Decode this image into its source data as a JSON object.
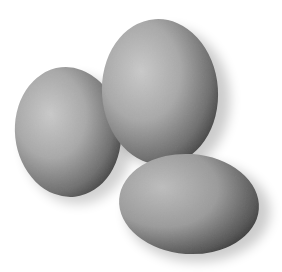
{
  "image": {
    "description": "Three grayscale eggs on a white background",
    "background": "#ffffff"
  },
  "eggs": [
    {
      "name": "left-egg",
      "cx": 68,
      "cy": 132,
      "rx": 53,
      "ry": 65,
      "rotate": -6
    },
    {
      "name": "top-egg",
      "cx": 160,
      "cy": 92,
      "rx": 58,
      "ry": 73,
      "rotate": -4
    },
    {
      "name": "bottom-right-egg",
      "cx": 189,
      "cy": 204,
      "rx": 70,
      "ry": 50,
      "rotate": 4
    }
  ]
}
